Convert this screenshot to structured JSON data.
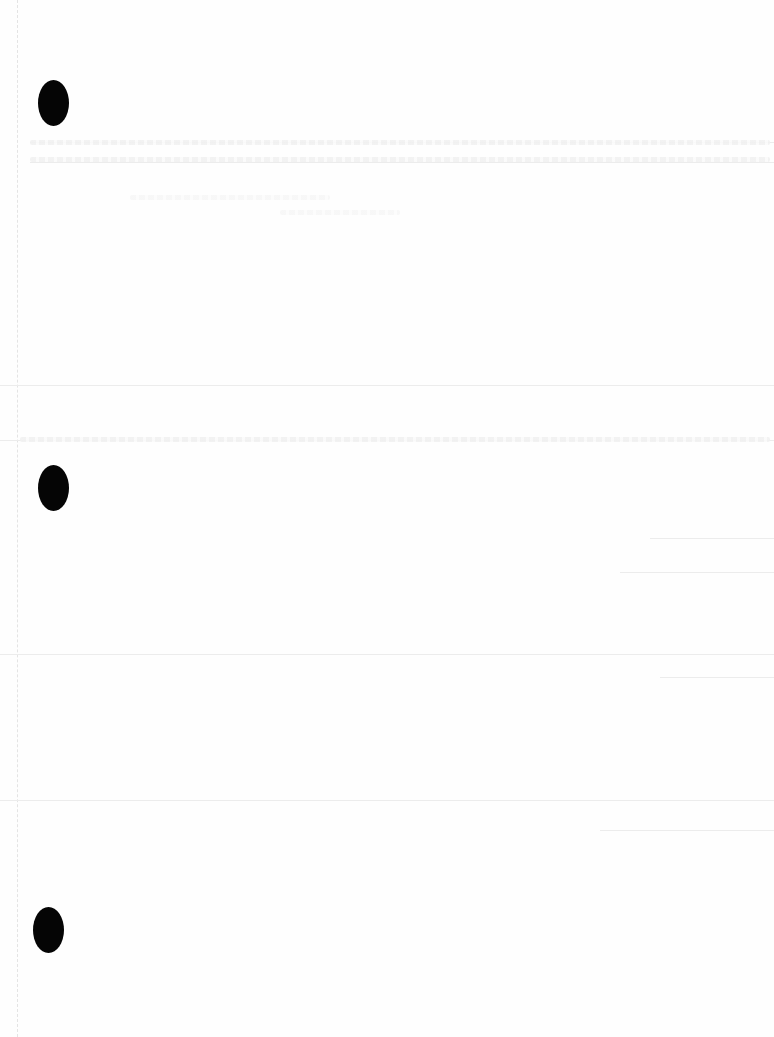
{
  "document": {
    "type": "scanned blank page",
    "punch_holes": [
      {
        "name": "top",
        "x": 38,
        "y": 92
      },
      {
        "name": "middle",
        "x": 38,
        "y": 465
      },
      {
        "name": "bottom",
        "x": 33,
        "y": 885
      }
    ],
    "shadow_lines_y": [
      142,
      162,
      385,
      440,
      538,
      572,
      654,
      668,
      800,
      830
    ],
    "colors": {
      "paper": "#fefefe",
      "hole": "#050505",
      "shadow": "#ececec"
    }
  }
}
